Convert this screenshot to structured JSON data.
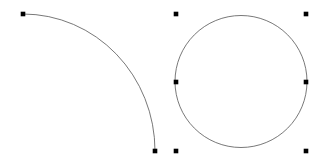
{
  "canvas": {
    "width": 327,
    "height": 159,
    "background_color": "#ffffff",
    "stroke_color": "#555555",
    "node_color": "#000000",
    "stroke_width": 0.8,
    "node_size": 4.6
  },
  "shapes": [
    {
      "name": "quarter-arc-path",
      "type": "elliptical-arc",
      "stroke_color": "#555555",
      "stroke_width": 0.8,
      "fill": "none",
      "start": {
        "x": 23,
        "y": 14
      },
      "end": {
        "x": 155,
        "y": 151
      },
      "center": {
        "x": 23,
        "y": 151
      },
      "rx": 132,
      "ry": 137,
      "large_arc": 0,
      "sweep": 1
    },
    {
      "name": "circle-path",
      "type": "circle",
      "stroke_color": "#555555",
      "stroke_width": 0.8,
      "fill": "none",
      "center": {
        "x": 241,
        "y": 81.5
      },
      "radius": 66
    }
  ],
  "nodes": [
    {
      "name": "arc-node-start",
      "x": 23,
      "y": 14
    },
    {
      "name": "arc-node-end",
      "x": 155,
      "y": 151
    },
    {
      "name": "circle-node-top",
      "x": 176,
      "y": 14
    },
    {
      "name": "circle-node-left",
      "x": 176,
      "y": 82
    },
    {
      "name": "circle-node-bottom",
      "x": 176,
      "y": 151
    },
    {
      "name": "circle-node-right",
      "x": 306,
      "y": 82
    },
    {
      "name": "handle-top-right",
      "x": 306,
      "y": 14
    },
    {
      "name": "handle-bottom-right",
      "x": 306,
      "y": 151
    }
  ]
}
